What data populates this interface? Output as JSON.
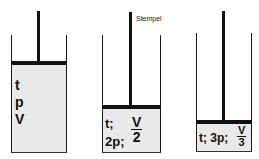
{
  "diagram": {
    "annotation": "Stempel",
    "cylinders": [
      {
        "id": 1,
        "labels": [
          "t",
          "p",
          "V"
        ]
      },
      {
        "id": 2,
        "line1": "t;",
        "line2": "2p;",
        "volume_num": "V",
        "volume_den": "2"
      },
      {
        "id": 3,
        "prefix": "t; 3p;",
        "volume_num": "V",
        "volume_den": "3"
      }
    ],
    "colors": {
      "gas_fill": "#e9e9e9",
      "piston": "#111111",
      "wall": "#1a1a1a"
    }
  }
}
